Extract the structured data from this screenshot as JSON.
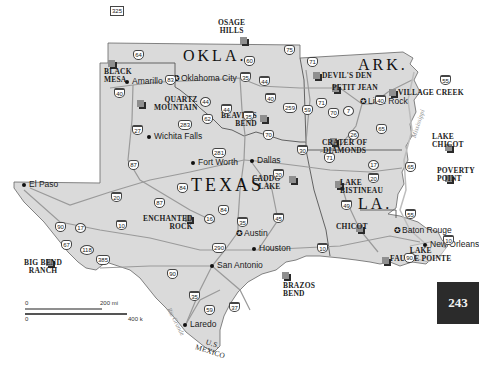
{
  "map": {
    "states": [
      {
        "label": "OKLA.",
        "x": 183,
        "y": 48,
        "size": 16
      },
      {
        "label": "ARK.",
        "x": 358,
        "y": 57,
        "size": 16
      },
      {
        "label": "TEXAS",
        "x": 191,
        "y": 176,
        "size": 18
      },
      {
        "label": "LA.",
        "x": 358,
        "y": 196,
        "size": 16
      }
    ],
    "cities": [
      {
        "name": "Amarillo",
        "x": 127,
        "y": 82,
        "dot": "dot"
      },
      {
        "name": "Oklahoma City",
        "x": 176,
        "y": 79,
        "dot": "capital"
      },
      {
        "name": "Little Rock",
        "x": 363,
        "y": 102,
        "dot": "capital"
      },
      {
        "name": "Wichita Falls",
        "x": 149,
        "y": 137,
        "dot": "dot"
      },
      {
        "name": "Fort Worth",
        "x": 193,
        "y": 163,
        "dot": "dot"
      },
      {
        "name": "Dallas",
        "x": 252,
        "y": 161,
        "dot": "dot"
      },
      {
        "name": "El Paso",
        "x": 24,
        "y": 185,
        "dot": "dot"
      },
      {
        "name": "Austin",
        "x": 239,
        "y": 234,
        "dot": "capital"
      },
      {
        "name": "Houston",
        "x": 254,
        "y": 249,
        "dot": "dot"
      },
      {
        "name": "San Antonio",
        "x": 212,
        "y": 266,
        "dot": "dot"
      },
      {
        "name": "Laredo",
        "x": 185,
        "y": 325,
        "dot": "dot"
      },
      {
        "name": "Baton Rouge",
        "x": 397,
        "y": 231,
        "dot": "capital"
      },
      {
        "name": "New Orleans",
        "x": 425,
        "y": 245,
        "dot": "dot"
      }
    ],
    "parks": [
      {
        "name": "BLACK MESA",
        "x": 108,
        "y": 60
      },
      {
        "name": "OSAGE HILLS",
        "x": 240,
        "y": 37
      },
      {
        "name": "QUARTZ MOUNTAIN",
        "x": 137,
        "y": 100
      },
      {
        "name": "DEVIL'S DEN",
        "x": 313,
        "y": 72
      },
      {
        "name": "PETIT JEAN",
        "x": 332,
        "y": 85
      },
      {
        "name": "VILLAGE CREEK",
        "x": 389,
        "y": 89
      },
      {
        "name": "BEAVERS BEND",
        "x": 260,
        "y": 115
      },
      {
        "name": "CRATER OF DIAMONDS",
        "x": 330,
        "y": 138
      },
      {
        "name": "LAKE CHICOT",
        "x": 445,
        "y": 144
      },
      {
        "name": "POVERTY POINT",
        "x": 445,
        "y": 175
      },
      {
        "name": "CADDO LAKE",
        "x": 289,
        "y": 176
      },
      {
        "name": "LAKE BISTINEAU",
        "x": 335,
        "y": 181
      },
      {
        "name": "ENCHANTED ROCK",
        "x": 185,
        "y": 215
      },
      {
        "name": "CHICOT",
        "x": 356,
        "y": 225
      },
      {
        "name": "LAKE FAUSSE POINTE",
        "x": 382,
        "y": 257
      },
      {
        "name": "BIG BEND RANCH",
        "x": 46,
        "y": 259
      },
      {
        "name": "BRAZOS BEND",
        "x": 282,
        "y": 272
      }
    ],
    "highways": [
      {
        "num": "325",
        "type": "us-box",
        "x": 110,
        "y": 6
      },
      {
        "num": "64",
        "type": "us",
        "x": 133,
        "y": 50
      },
      {
        "num": "83",
        "type": "us",
        "x": 165,
        "y": 75
      },
      {
        "num": "40",
        "type": "interstate",
        "x": 114,
        "y": 88
      },
      {
        "num": "44",
        "type": "state",
        "x": 200,
        "y": 97
      },
      {
        "num": "44",
        "type": "interstate",
        "x": 221,
        "y": 104
      },
      {
        "num": "62",
        "type": "us",
        "x": 202,
        "y": 114
      },
      {
        "num": "283",
        "type": "us",
        "x": 178,
        "y": 120
      },
      {
        "num": "27",
        "type": "interstate",
        "x": 132,
        "y": 125
      },
      {
        "num": "87",
        "type": "us",
        "x": 128,
        "y": 160
      },
      {
        "num": "281",
        "type": "us",
        "x": 212,
        "y": 148
      },
      {
        "num": "75",
        "type": "us",
        "x": 284,
        "y": 45
      },
      {
        "num": "60",
        "type": "us",
        "x": 244,
        "y": 56
      },
      {
        "num": "35",
        "type": "interstate",
        "x": 240,
        "y": 72
      },
      {
        "num": "44",
        "type": "interstate",
        "x": 259,
        "y": 76
      },
      {
        "num": "40",
        "type": "interstate",
        "x": 265,
        "y": 93
      },
      {
        "num": "35",
        "type": "interstate",
        "x": 243,
        "y": 111
      },
      {
        "num": "70",
        "type": "us",
        "x": 263,
        "y": 130
      },
      {
        "num": "71",
        "type": "us",
        "x": 307,
        "y": 57
      },
      {
        "num": "259",
        "type": "us",
        "x": 283,
        "y": 103
      },
      {
        "num": "59",
        "type": "us",
        "x": 302,
        "y": 105
      },
      {
        "num": "71",
        "type": "us",
        "x": 316,
        "y": 98
      },
      {
        "num": "70",
        "type": "us",
        "x": 328,
        "y": 108
      },
      {
        "num": "7",
        "type": "state",
        "x": 343,
        "y": 106
      },
      {
        "num": "40",
        "type": "interstate",
        "x": 375,
        "y": 95
      },
      {
        "num": "55",
        "type": "interstate",
        "x": 440,
        "y": 75
      },
      {
        "num": "65",
        "type": "us",
        "x": 376,
        "y": 124
      },
      {
        "num": "26",
        "type": "state",
        "x": 348,
        "y": 130
      },
      {
        "num": "30",
        "type": "interstate",
        "x": 297,
        "y": 145
      },
      {
        "num": "71",
        "type": "us",
        "x": 324,
        "y": 153
      },
      {
        "num": "17",
        "type": "state",
        "x": 368,
        "y": 160
      },
      {
        "num": "65",
        "type": "us",
        "x": 405,
        "y": 162
      },
      {
        "num": "20",
        "type": "interstate",
        "x": 273,
        "y": 169
      },
      {
        "num": "20",
        "type": "interstate",
        "x": 368,
        "y": 173
      },
      {
        "num": "49",
        "type": "interstate",
        "x": 341,
        "y": 200
      },
      {
        "num": "55",
        "type": "interstate",
        "x": 405,
        "y": 209
      },
      {
        "num": "10",
        "type": "interstate",
        "x": 443,
        "y": 235
      },
      {
        "num": "84",
        "type": "us",
        "x": 177,
        "y": 183
      },
      {
        "num": "84",
        "type": "us",
        "x": 218,
        "y": 205
      },
      {
        "num": "20",
        "type": "interstate",
        "x": 111,
        "y": 192
      },
      {
        "num": "87",
        "type": "us",
        "x": 154,
        "y": 198
      },
      {
        "num": "16",
        "type": "state",
        "x": 204,
        "y": 214
      },
      {
        "num": "35",
        "type": "interstate",
        "x": 237,
        "y": 217
      },
      {
        "num": "45",
        "type": "interstate",
        "x": 273,
        "y": 213
      },
      {
        "num": "90",
        "type": "us",
        "x": 55,
        "y": 222
      },
      {
        "num": "17",
        "type": "state",
        "x": 75,
        "y": 223
      },
      {
        "num": "10",
        "type": "interstate",
        "x": 116,
        "y": 220
      },
      {
        "num": "67",
        "type": "us",
        "x": 61,
        "y": 240
      },
      {
        "num": "118",
        "type": "state",
        "x": 80,
        "y": 245
      },
      {
        "num": "385",
        "type": "us",
        "x": 96,
        "y": 255
      },
      {
        "num": "290",
        "type": "us",
        "x": 212,
        "y": 243
      },
      {
        "num": "10",
        "type": "interstate",
        "x": 317,
        "y": 243
      },
      {
        "num": "90",
        "type": "us",
        "x": 167,
        "y": 269
      },
      {
        "num": "35",
        "type": "interstate",
        "x": 189,
        "y": 291
      },
      {
        "num": "59",
        "type": "us",
        "x": 204,
        "y": 305
      },
      {
        "num": "37",
        "type": "interstate",
        "x": 229,
        "y": 302
      },
      {
        "num": "90",
        "type": "us",
        "x": 404,
        "y": 253
      }
    ],
    "rivers": [
      {
        "name": "Mississippi",
        "x": 403,
        "y": 120,
        "rot": -72
      },
      {
        "name": "Rio Grande",
        "x": 161,
        "y": 318,
        "rot": 62
      }
    ],
    "border_label": {
      "line1": "U.S.",
      "line2": "MEXICO",
      "x": 200,
      "y": 350
    }
  },
  "scale": {
    "top_zero": "0",
    "top_label": "200 mi",
    "bottom_zero": "0",
    "bottom_label": "400 k"
  },
  "page_number": "243",
  "colors": {
    "land": "#d9d9d9",
    "land_outside": "#e6e6e6",
    "road": "#9a9a9a",
    "border": "#555555",
    "park_front": "#2a2a2a",
    "park_back": "#8f8f8f",
    "page_tab": "#2b2b2b"
  }
}
